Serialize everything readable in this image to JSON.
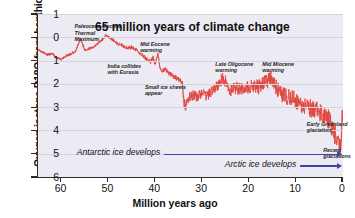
{
  "chart_data": {
    "type": "line",
    "title": "65 million years of climate change",
    "xlabel": "Million years ago",
    "ylabel": "Oxygen isotope D18O from benthic foraminifera",
    "xlim": [
      65,
      0
    ],
    "ylim": [
      6,
      -1
    ],
    "x_reversed": true,
    "y_inverted": true,
    "grid": true,
    "legend": "none",
    "series_color": "#e0443c",
    "xticks": [
      "60",
      "50",
      "40",
      "30",
      "20",
      "10",
      "0"
    ],
    "xtick_values": [
      60,
      50,
      40,
      30,
      20,
      10,
      0
    ],
    "yticks": [
      "1",
      "0",
      "1",
      "2",
      "3",
      "4",
      "5",
      "6"
    ],
    "ytick_values": [
      -1,
      0,
      1,
      2,
      3,
      4,
      5,
      6
    ],
    "series": [
      {
        "name": "Oxygen isotope D18O (benthic foraminifera)",
        "x": [
          65.0,
          64.0,
          63.0,
          62.0,
          61.0,
          60.0,
          59.0,
          58.0,
          57.0,
          56.5,
          56.0,
          55.5,
          55.0,
          54.0,
          53.0,
          52.0,
          51.0,
          50.5,
          50.0,
          49.0,
          48.0,
          47.0,
          46.0,
          45.0,
          44.0,
          43.0,
          42.0,
          41.0,
          40.5,
          40.0,
          39.5,
          39.0,
          38.5,
          38.0,
          37.0,
          36.0,
          35.0,
          34.5,
          34.2,
          34.0,
          33.8,
          33.5,
          33.0,
          32.0,
          31.0,
          30.0,
          29.0,
          28.0,
          27.5,
          27.0,
          26.0,
          25.5,
          25.0,
          24.5,
          24.0,
          23.0,
          22.0,
          21.0,
          20.0,
          19.0,
          18.0,
          17.0,
          16.0,
          15.5,
          15.0,
          14.5,
          14.0,
          13.0,
          12.0,
          11.0,
          10.0,
          9.0,
          8.0,
          7.0,
          6.0,
          5.0,
          4.0,
          3.0,
          2.5,
          2.0,
          1.5,
          1.0,
          0.5,
          0.2,
          0.0
        ],
        "y": [
          0.55,
          0.62,
          0.75,
          0.7,
          0.88,
          0.95,
          0.8,
          0.72,
          0.6,
          0.35,
          0.05,
          0.3,
          0.55,
          0.48,
          0.4,
          0.22,
          0.05,
          -0.1,
          0.0,
          0.12,
          0.28,
          0.35,
          0.48,
          0.42,
          0.55,
          0.72,
          0.9,
          1.05,
          0.85,
          1.15,
          0.72,
          1.3,
          1.45,
          1.35,
          1.55,
          1.7,
          1.8,
          1.88,
          1.95,
          2.7,
          2.85,
          2.95,
          2.6,
          2.5,
          2.55,
          2.45,
          2.52,
          2.35,
          2.25,
          2.1,
          1.85,
          1.78,
          1.92,
          2.05,
          2.3,
          2.15,
          2.25,
          2.1,
          2.2,
          2.05,
          2.15,
          1.98,
          1.88,
          1.75,
          1.8,
          2.05,
          2.25,
          2.45,
          2.55,
          2.6,
          2.72,
          2.85,
          2.95,
          3.05,
          3.15,
          3.2,
          3.35,
          3.55,
          3.75,
          4.05,
          4.3,
          4.55,
          4.85,
          3.6,
          3.1
        ]
      }
    ],
    "annotations": [
      {
        "id": "paleocene-eocene-thermal-maximum",
        "text": "Paleocene-Eocene\nThermal\nMaximum",
        "x": 57,
        "y": -0.6
      },
      {
        "id": "india-collides-with-eurasia",
        "text": "India collides\nwith Eurasia",
        "x": 50,
        "y": 1.1
      },
      {
        "id": "mid-eocene-warming",
        "text": "Mid Eocene\nwarming",
        "x": 43,
        "y": 0.15
      },
      {
        "id": "small-ice-sheets-appear",
        "text": "Small ice sheets\nappear",
        "x": 42,
        "y": 2.0
      },
      {
        "id": "late-oligocene-warming",
        "text": "Late Oligocene\nwarming",
        "x": 27,
        "y": 1.0
      },
      {
        "id": "mid-miocene-warming",
        "text": "Mid Miocene\nwarming",
        "x": 17,
        "y": 1.0
      },
      {
        "id": "early-greenland-glaciation",
        "text": "Early Greenland\nglaciation",
        "x": 7.5,
        "y": 3.6
      },
      {
        "id": "recent-glaciations",
        "text": "Recent glaciations",
        "x": 4.0,
        "y": 4.7
      }
    ],
    "arrows": [
      {
        "id": "antarctic-ice-develops",
        "label": "Antarctic ice develops",
        "x_start": 38,
        "x_end": 0,
        "y": 5.0,
        "color": "#3b46a8"
      },
      {
        "id": "arctic-ice-develops",
        "label": "Arctic ice develops",
        "x_start": 9,
        "x_end": 0,
        "y": 5.5,
        "color": "#3b46a8"
      }
    ]
  }
}
